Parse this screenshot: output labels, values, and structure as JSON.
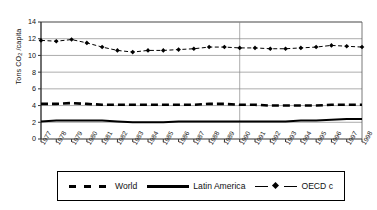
{
  "chart_data": {
    "type": "line",
    "title": "",
    "xlabel": "",
    "ylabel": "Tons CO2 /capita",
    "ylabel_main": "Tons CO",
    "ylabel_sub": "2",
    "ylabel_tail": " /capita",
    "ylim": [
      0,
      14
    ],
    "ytick_step": 2,
    "yticks": [
      14,
      12,
      10,
      8,
      6,
      4,
      2,
      0
    ],
    "grid": "horizontal",
    "legend_position": "bottom",
    "categories": [
      "1977",
      "1978",
      "1979",
      "1980",
      "1981",
      "1982",
      "1983",
      "1984",
      "1985",
      "1986",
      "1987",
      "1988",
      "1989",
      "1990",
      "1991",
      "1992",
      "1993",
      "1994",
      "1995",
      "1996",
      "1997",
      "1998"
    ],
    "vertical_marker_year": "1990",
    "series": [
      {
        "name": "World",
        "style": "dashed",
        "marker": "none",
        "color": "#000000",
        "values": [
          4.2,
          4.2,
          4.3,
          4.2,
          4.1,
          4.1,
          4.1,
          4.1,
          4.1,
          4.1,
          4.1,
          4.2,
          4.2,
          4.1,
          4.1,
          4.0,
          4.0,
          4.0,
          4.0,
          4.1,
          4.1,
          4.1
        ]
      },
      {
        "name": "Latin America",
        "style": "solid",
        "marker": "none",
        "color": "#000000",
        "values": [
          2.1,
          2.2,
          2.2,
          2.2,
          2.2,
          2.1,
          2.0,
          2.0,
          2.0,
          2.1,
          2.1,
          2.1,
          2.1,
          2.1,
          2.1,
          2.1,
          2.1,
          2.2,
          2.2,
          2.3,
          2.4,
          2.4
        ]
      },
      {
        "name": "OECD c",
        "style": "dash-dot",
        "marker": "diamond",
        "color": "#000000",
        "values": [
          11.8,
          11.7,
          11.9,
          11.5,
          11.0,
          10.6,
          10.4,
          10.6,
          10.6,
          10.7,
          10.8,
          11.0,
          11.0,
          10.9,
          10.9,
          10.8,
          10.8,
          10.9,
          11.0,
          11.2,
          11.1,
          11.0
        ]
      }
    ]
  },
  "legend": {
    "items": [
      {
        "label": "World",
        "style": "dashed"
      },
      {
        "label": "Latin America",
        "style": "solid"
      },
      {
        "label": "OECD c",
        "style": "dash-dot-marker"
      }
    ]
  }
}
